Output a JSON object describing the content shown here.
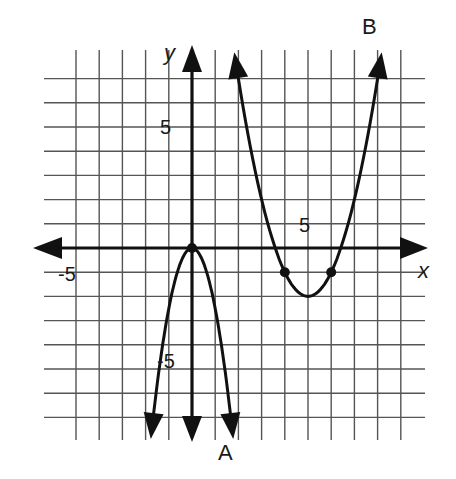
{
  "chart_data": {
    "type": "line",
    "title": "",
    "xlabel": "x",
    "ylabel": "y",
    "xlim": [
      -6,
      9
    ],
    "ylim": [
      -8,
      8
    ],
    "grid": true,
    "tick_labels": {
      "x": [
        {
          "value": -5,
          "label": "-5"
        },
        {
          "value": 5,
          "label": "5"
        }
      ],
      "y": [
        {
          "value": 5,
          "label": "5"
        },
        {
          "value": -5,
          "label": "-5"
        }
      ]
    },
    "series": [
      {
        "name": "A",
        "equation": "y = -2x^2",
        "vertex": [
          0,
          0
        ],
        "opens": "down",
        "marked_points": [
          [
            0,
            0
          ]
        ],
        "x": [
          -1.75,
          -1.5,
          -1,
          -0.5,
          0,
          0.5,
          1,
          1.5,
          1.75
        ],
        "y": [
          -6.1,
          -4.5,
          -2,
          -0.5,
          0,
          -0.5,
          -2,
          -4.5,
          -6.1
        ]
      },
      {
        "name": "B",
        "equation": "y = (x-5)^2 - 2",
        "vertex": [
          5,
          -2
        ],
        "opens": "up",
        "marked_points": [
          [
            4,
            -1
          ],
          [
            6,
            -1
          ]
        ],
        "x": [
          2.1,
          3,
          4,
          5,
          6,
          7,
          7.9
        ],
        "y": [
          6.4,
          2,
          -1,
          -2,
          -1,
          2,
          6.4
        ]
      }
    ],
    "annotations": [
      "A",
      "B"
    ]
  },
  "labels": {
    "x_axis": "x",
    "y_axis": "y",
    "x_pos_tick": "5",
    "x_neg_tick": "-5",
    "y_pos_tick": "5",
    "y_neg_tick": "-5",
    "curve_a": "A",
    "curve_b": "B"
  },
  "colors": {
    "grid": "#555555",
    "axis": "#111111",
    "curve": "#111111",
    "background": "#ffffff"
  }
}
